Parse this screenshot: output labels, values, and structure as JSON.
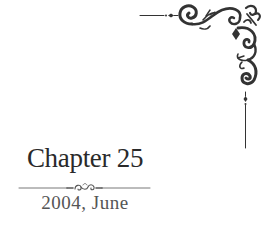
{
  "chapter": {
    "title": "Chapter 25",
    "date": "2004, June"
  },
  "ornaments": {
    "corner": "flourish-corner-top-right",
    "divider": "scroll-divider"
  },
  "colors": {
    "ink": "#2a2a2a",
    "date": "#555555",
    "background": "#ffffff"
  }
}
